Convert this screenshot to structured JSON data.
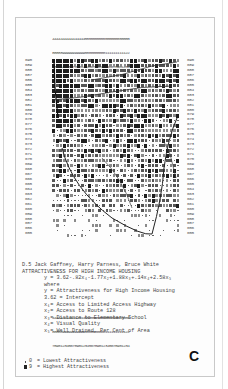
{
  "figure": {
    "plate_letter": "C",
    "column_header": {
      "line1": "44444444444444445555555555555555555555",
      "line2": "88888999999999990000000000111111111122",
      "line3": "78901234567890123456789012345678901234"
    },
    "row_labels": [
      "690",
      "689",
      "688",
      "687",
      "686",
      "685",
      "684",
      "683",
      "682",
      "681",
      "680",
      "679",
      "678",
      "677",
      "676",
      "675",
      "674",
      "673",
      "672",
      "671",
      "670",
      "669",
      "668",
      "667",
      "666",
      "665",
      "664",
      "663",
      "662",
      "661",
      "660",
      "659",
      "658",
      "657",
      "656",
      "655"
    ],
    "caption": {
      "authors": "D.5  Jack Gaffney, Harry Parness, Bruce White",
      "title": "ATTRACTIVENESS FOR HIGH INCOME HOUSING",
      "equation": "y = 3.62-.82x₁-1.77x₂+1.88x₃+.14x₄+2.58x₅",
      "where": "where",
      "definitions": [
        "y = Attractiveness for High Income Housing",
        "3.62 = Intercept",
        "x₁= Access to Limited Access Highway",
        "x₂= Access to Route 128",
        "x₃= Distance to Elementary School",
        "x₄= Visual Quality",
        "x₅= Well Drained, Per Cent of Area"
      ]
    },
    "legend": [
      {
        "symbol": "dot",
        "code": "0",
        "label": "= Lowest Attractiveness"
      },
      {
        "symbol": "block",
        "code": "9",
        "label": "= Highest Attractiveness"
      }
    ],
    "colors": {
      "ink": "#222222",
      "mid": "#6a6a6a",
      "light": "#a8a8a8",
      "paper": "#fdfdfd"
    }
  }
}
